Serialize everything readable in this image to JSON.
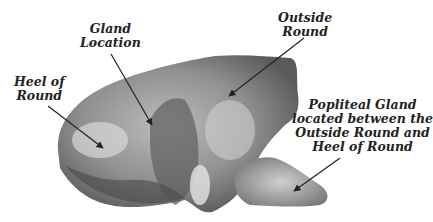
{
  "diagram": {
    "background": "#ffffff",
    "label_color": "#222222",
    "labels": [
      {
        "id": "gland-location",
        "lines": [
          "Gland",
          "Location"
        ]
      },
      {
        "id": "outside-round",
        "lines": [
          "Outside",
          "Round"
        ]
      },
      {
        "id": "heel-of-round",
        "lines": [
          "Heel of",
          "Round"
        ]
      },
      {
        "id": "popliteal-gland",
        "lines": [
          "Popliteal Gland",
          "located between the",
          "Outside Round and",
          "Heel of Round"
        ]
      }
    ]
  }
}
